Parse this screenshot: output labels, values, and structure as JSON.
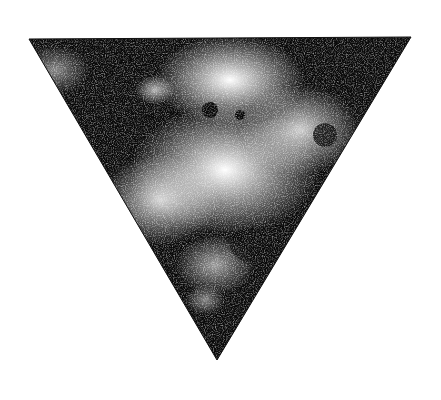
{
  "image": {
    "description": "Inverted triangle with mottled black-and-white speckled texture on white background",
    "background": "#ffffff",
    "shape": {
      "type": "inverted-triangle",
      "vertices": [
        [
          29,
          39
        ],
        [
          411,
          37
        ],
        [
          217,
          360
        ]
      ],
      "dark_color": "#0a0a0a",
      "light_color": "#f2f2f2"
    }
  }
}
